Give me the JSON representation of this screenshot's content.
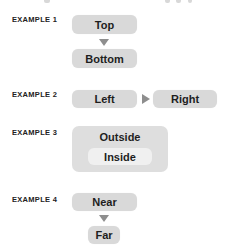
{
  "examples": [
    {
      "label": "EXAMPLE 1",
      "layout": "vertical",
      "first": "Top",
      "second": "Bottom",
      "arrow": "down-arrow"
    },
    {
      "label": "EXAMPLE 2",
      "layout": "horizontal",
      "first": "Left",
      "second": "Right",
      "arrow": "right-arrow"
    },
    {
      "label": "EXAMPLE 3",
      "layout": "nested",
      "outer": "Outside",
      "inner": "Inside"
    },
    {
      "label": "EXAMPLE 4",
      "layout": "vertical",
      "first": "Near",
      "second": "Far",
      "arrow": "down-arrow"
    }
  ],
  "colors": {
    "box_fill": "#d9d9d9",
    "outer_fill": "#dedede",
    "inner_fill": "#f0f0f0",
    "arrow": "#8e8e8e",
    "text": "#1e1e1e"
  }
}
